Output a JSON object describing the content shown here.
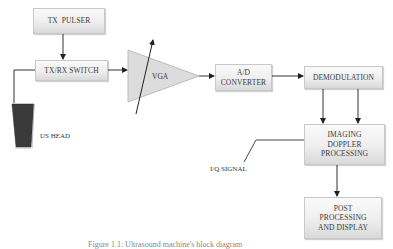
{
  "diagram": {
    "blocks": {
      "tx_pulser": "TX  PULSER",
      "txrx_switch": "TX/RX SWITCH",
      "vga": "VGA",
      "ad_converter_line1": "A/D",
      "ad_converter_line2": "CONVERTER",
      "demodulation": "DEMODULATION",
      "imaging_line1": "IMAGING",
      "imaging_line2": "DOPPLER",
      "imaging_line3": "PROCESSING",
      "post_line1": "POST",
      "post_line2": "PROCESSING",
      "post_line3": "AND DISPLAY"
    },
    "labels": {
      "us_head": "US HEAD",
      "iq_signal": "I/Q SIGNAL"
    },
    "caption": "Figure 1.1: Ultrasound machine's block diagram",
    "edges": [
      {
        "from": "TX PULSER",
        "to": "TX/RX SWITCH"
      },
      {
        "from": "TX/RX SWITCH",
        "to": "US HEAD"
      },
      {
        "from": "TX/RX SWITCH",
        "to": "VGA"
      },
      {
        "from": "VGA",
        "to": "A/D CONVERTER"
      },
      {
        "from": "A/D CONVERTER",
        "to": "DEMODULATION"
      },
      {
        "from": "DEMODULATION",
        "to": "IMAGING DOPPLER PROCESSING",
        "count": 2
      },
      {
        "from": "IMAGING DOPPLER PROCESSING",
        "to": "POST PROCESSING AND DISPLAY"
      }
    ],
    "colors": {
      "box_fill_top": "#fafafa",
      "box_fill_bottom": "#d9d9d9",
      "line": "#333333",
      "probe": "#3a3a3a"
    }
  }
}
